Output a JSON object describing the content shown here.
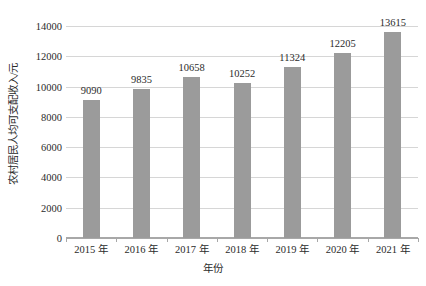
{
  "chart_data": {
    "type": "bar",
    "title": "",
    "subtitle": "",
    "xlabel": "年份",
    "ylabel": "农村居民人均可支配收入/元",
    "categories": [
      "2015 年",
      "2016 年",
      "2017 年",
      "2018 年",
      "2019 年",
      "2020 年",
      "2021 年"
    ],
    "values": [
      9090,
      9835,
      10658,
      10252,
      11324,
      12205,
      13615
    ],
    "data_labels": [
      "9090",
      "9835",
      "10658",
      "10252",
      "11324",
      "12205",
      "13615"
    ],
    "ylim": [
      0,
      14000
    ],
    "ytick_labels": [
      "0",
      "2000",
      "4000",
      "6000",
      "8000",
      "10000",
      "12000",
      "14000"
    ],
    "ytick_values": [
      0,
      2000,
      4000,
      6000,
      8000,
      10000,
      12000,
      14000
    ],
    "grid": true,
    "legend": null,
    "legend_position": "none",
    "series": [
      {
        "name": "农村居民人均可支配收入",
        "color": "#9b9b9b",
        "values": [
          9090,
          9835,
          10658,
          10252,
          11324,
          12205,
          13615
        ]
      }
    ],
    "colors": {
      "bar": "#9b9b9b",
      "gridline": "#d6d6d6",
      "axis": "#a8a8a8",
      "text": "#2b2b2b",
      "background": "#ffffff"
    }
  }
}
